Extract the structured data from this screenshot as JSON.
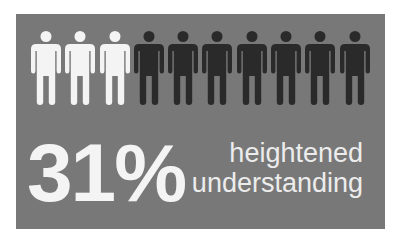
{
  "infographic": {
    "percentage": "31%",
    "caption_line1": "heightened",
    "caption_line2": "understanding",
    "figures_total": 10,
    "figures_highlighted": 3,
    "colors": {
      "background": "#ffffff",
      "panel": "#787878",
      "figure_highlight": "#f4f4f4",
      "figure_default": "#2a2a2a",
      "text": "#f4f4f4"
    },
    "icon": "person-icon"
  }
}
